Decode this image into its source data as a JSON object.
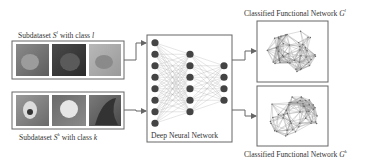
{
  "subdataset_top": {
    "prefix": "Subdataset ",
    "symbol": "S",
    "sup": "l",
    "middle": " with class ",
    "cls": "l",
    "images": [
      "cat-image-1",
      "cat-image-2",
      "cat-image-3"
    ]
  },
  "subdataset_bottom": {
    "prefix": "Subdataset ",
    "symbol": "S",
    "sup": "k",
    "middle": " with class ",
    "cls": "k",
    "images": [
      "dog-image-1",
      "dog-image-2",
      "bird-image-3"
    ]
  },
  "dnn": {
    "label": "Deep Neural Network",
    "layers": [
      8,
      6,
      4
    ]
  },
  "network_top": {
    "prefix": "Classified Functional Network ",
    "symbol": "G",
    "sup": "l"
  },
  "network_bottom": {
    "prefix": "Classified Functional Network ",
    "symbol": "G",
    "sup": "k"
  },
  "colors": {
    "stroke": "#555555",
    "node": "#444444",
    "edge": "#aaaaaa"
  }
}
